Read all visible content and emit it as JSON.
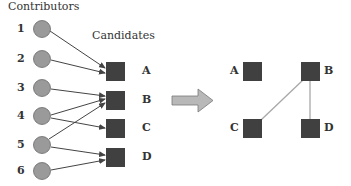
{
  "titles": {
    "contributors": "Contributors",
    "candidates": "Candidates"
  },
  "contributors": [
    {
      "label": "1",
      "y": 29
    },
    {
      "label": "2",
      "y": 59
    },
    {
      "label": "3",
      "y": 88
    },
    {
      "label": "4",
      "y": 116
    },
    {
      "label": "5",
      "y": 145
    },
    {
      "label": "6",
      "y": 171
    }
  ],
  "candidates": [
    {
      "label": "A",
      "y": 71
    },
    {
      "label": "B",
      "y": 100
    },
    {
      "label": "C",
      "y": 128
    },
    {
      "label": "D",
      "y": 157
    }
  ],
  "edges": [
    [
      "1",
      "A"
    ],
    [
      "2",
      "A"
    ],
    [
      "3",
      "B"
    ],
    [
      "4",
      "B"
    ],
    [
      "4",
      "C"
    ],
    [
      "5",
      "B"
    ],
    [
      "5",
      "D"
    ],
    [
      "6",
      "D"
    ]
  ],
  "result_graph": {
    "nodes": [
      {
        "label": "A",
        "x": 252,
        "y": 71
      },
      {
        "label": "B",
        "x": 310,
        "y": 71
      },
      {
        "label": "C",
        "x": 252,
        "y": 128
      },
      {
        "label": "D",
        "x": 310,
        "y": 128
      }
    ],
    "edges": [
      [
        "B",
        "C"
      ],
      [
        "B",
        "D"
      ]
    ]
  },
  "colors": {
    "circle_fill": "#9a9a9a",
    "circle_stroke": "#6a6a6a",
    "square_fill": "#404040",
    "arrow_line": "#444444",
    "block_arrow_fill": "#b8b8b8",
    "graph_edge": "#a8a8a8"
  }
}
